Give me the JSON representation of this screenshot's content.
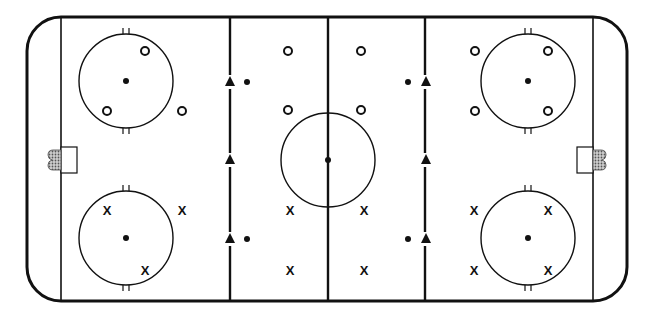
{
  "diagram": {
    "type": "hockey-rink-drill",
    "colors": {
      "line": "#111111",
      "background": "#ffffff",
      "net": "#9a9a9a"
    },
    "rink": {
      "x": 27,
      "y": 17,
      "width": 600,
      "height": 284,
      "corner_radius": 34
    },
    "goal_lines_x": [
      61,
      593
    ],
    "blue_lines_x": [
      230,
      425
    ],
    "center_line_x": 328,
    "center_circle": {
      "cx": 328,
      "cy": 160,
      "r": 47
    },
    "faceoff_circles": [
      {
        "cx": 126,
        "cy": 81,
        "r": 47
      },
      {
        "cx": 126,
        "cy": 238,
        "r": 47
      },
      {
        "cx": 528,
        "cy": 81,
        "r": 47
      },
      {
        "cx": 528,
        "cy": 238,
        "r": 47
      }
    ],
    "goals": [
      {
        "side": "left",
        "crease_x": 61,
        "y": 147,
        "w": 16,
        "h": 26
      },
      {
        "side": "right",
        "crease_x": 577,
        "y": 147,
        "w": 16,
        "h": 26
      }
    ],
    "faceoff_dots": [
      {
        "cx": 247,
        "cy": 82
      },
      {
        "cx": 247,
        "cy": 239
      },
      {
        "cx": 408,
        "cy": 82
      },
      {
        "cx": 408,
        "cy": 239
      }
    ],
    "cones": [
      {
        "cx": 230,
        "cy": 82
      },
      {
        "cx": 230,
        "cy": 160
      },
      {
        "cx": 230,
        "cy": 239
      },
      {
        "cx": 426,
        "cy": 82
      },
      {
        "cx": 426,
        "cy": 160
      },
      {
        "cx": 426,
        "cy": 239
      }
    ],
    "players_o": [
      {
        "cx": 145,
        "cy": 51
      },
      {
        "cx": 107,
        "cy": 111
      },
      {
        "cx": 182,
        "cy": 111
      },
      {
        "cx": 288,
        "cy": 51
      },
      {
        "cx": 288,
        "cy": 110
      },
      {
        "cx": 361,
        "cy": 51
      },
      {
        "cx": 361,
        "cy": 110
      },
      {
        "cx": 475,
        "cy": 51
      },
      {
        "cx": 548,
        "cy": 51
      },
      {
        "cx": 475,
        "cy": 111
      },
      {
        "cx": 548,
        "cy": 111
      }
    ],
    "players_x": [
      {
        "x": 107,
        "y": 210,
        "label": "X"
      },
      {
        "x": 182,
        "y": 210,
        "label": "X"
      },
      {
        "x": 145,
        "y": 270,
        "label": "X"
      },
      {
        "x": 290,
        "y": 210,
        "label": "X"
      },
      {
        "x": 290,
        "y": 270,
        "label": "X"
      },
      {
        "x": 364,
        "y": 210,
        "label": "X"
      },
      {
        "x": 364,
        "y": 270,
        "label": "X"
      },
      {
        "x": 474,
        "y": 210,
        "label": "X"
      },
      {
        "x": 548,
        "y": 210,
        "label": "X"
      },
      {
        "x": 474,
        "y": 270,
        "label": "X"
      },
      {
        "x": 548,
        "y": 270,
        "label": "X"
      }
    ]
  }
}
